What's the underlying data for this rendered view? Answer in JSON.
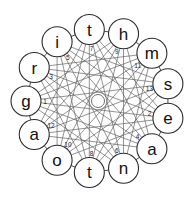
{
  "figure": {
    "width": 196,
    "height": 202,
    "background_color": "#ffffff"
  },
  "style": {
    "node_fill": "#ffffff",
    "node_stroke": "#2b2b2b",
    "chord_stroke": "#5a5a5a",
    "ring_stroke": "#3a3a3a",
    "center_stroke": "#6d6d6d",
    "letter_color": "#111111",
    "index_color": "#1a1a1a"
  },
  "layout": {
    "center_x": 98,
    "center_y": 101,
    "ring_radius": 72,
    "node_radius": 15,
    "center_hub_radius": 6.5,
    "index_radius": 53,
    "node_count": 13,
    "start_angle_deg": 180,
    "chord_step": 5
  },
  "chart_data": {
    "type": "diagram",
    "nodes": [
      {
        "index": 1,
        "letter": "g",
        "position": "left",
        "angle_deg": 180
      },
      {
        "index": 2,
        "letter": "e",
        "position": "lower-right",
        "angle_deg": 152.3
      },
      {
        "index": 3,
        "letter": "r",
        "position": "upper-left",
        "angle_deg": 207.7
      },
      {
        "index": 4,
        "letter": "a",
        "position": "bottom-right",
        "angle_deg": 124.6
      },
      {
        "index": 5,
        "letter": "i",
        "position": "top-left",
        "angle_deg": 235.4
      },
      {
        "index": 6,
        "letter": "n",
        "position": "bottom",
        "angle_deg": 96.9
      },
      {
        "index": 7,
        "letter": "t",
        "position": "top",
        "angle_deg": 263.1
      },
      {
        "index": 8,
        "letter": "t",
        "position": "bottom-left",
        "angle_deg": 69.2
      },
      {
        "index": 9,
        "letter": "h",
        "position": "top-right",
        "angle_deg": 290.8
      },
      {
        "index": 10,
        "letter": "o",
        "position": "lower-left",
        "angle_deg": 41.5
      },
      {
        "index": 11,
        "letter": "m",
        "position": "upper-right",
        "angle_deg": 318.5
      },
      {
        "index": 12,
        "letter": "a",
        "position": "left-lower",
        "angle_deg": 13.8
      },
      {
        "index": 13,
        "letter": "s",
        "position": "right",
        "angle_deg": 346.2
      }
    ],
    "ring_order_clockwise": [
      "g",
      "r",
      "i",
      "t",
      "h",
      "m",
      "s",
      "e",
      "a",
      "n",
      "t",
      "o",
      "a"
    ],
    "index_sequence": [
      1,
      3,
      5,
      7,
      9,
      11,
      13,
      2,
      4,
      6,
      8,
      10,
      12
    ],
    "word": "grithmseanatoa"
  }
}
